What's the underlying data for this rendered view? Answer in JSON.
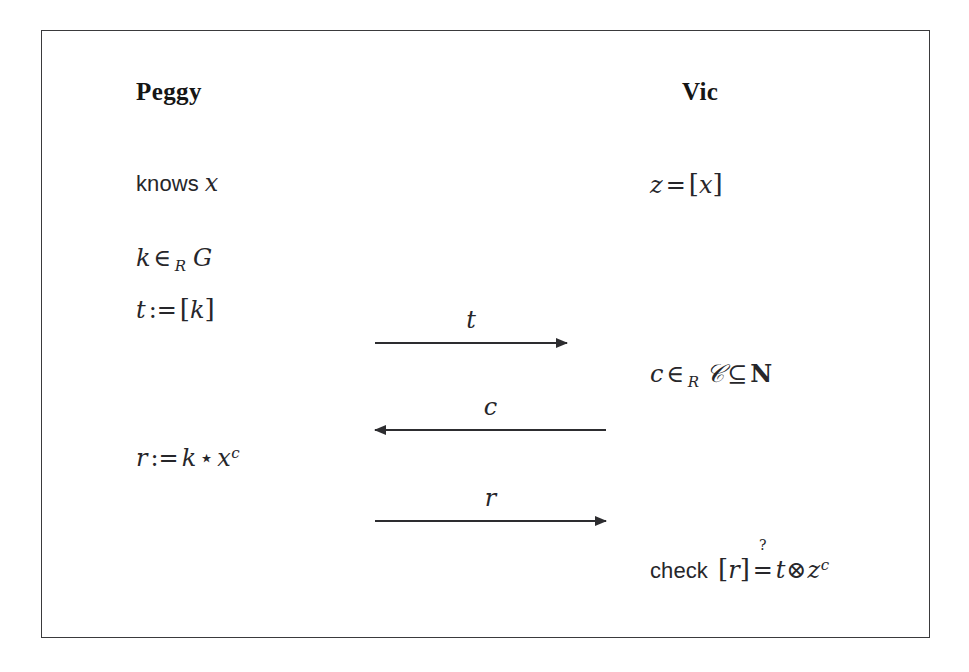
{
  "figure": {
    "title_peggy": "Peggy",
    "title_vic": "Vic",
    "frame_color": "#3a3a3c",
    "background_color": "#ffffff",
    "text_color": "#26262a"
  },
  "prover": {
    "label": "Peggy",
    "lines": [
      {
        "id": "knows-x",
        "plain": "knows x"
      },
      {
        "id": "k-in-g",
        "plain": "k ∈_R G"
      },
      {
        "id": "t-assign",
        "plain": "t := [k]"
      },
      {
        "id": "r-assign",
        "plain": "r := k ⋆ x^c"
      }
    ],
    "knows_word": "knows",
    "knows_var": "x",
    "k_var": "k",
    "in_op": "∈",
    "in_sub": "R",
    "group": "G",
    "t_var": "t",
    "assign_op": ":=",
    "bracket_open": "[",
    "bracket_close": "]",
    "t_inner": "k",
    "r_var": "r",
    "r_k": "k",
    "star_op": "⋆",
    "r_x": "x",
    "r_exp": "c"
  },
  "verifier": {
    "label": "Vic",
    "lines": [
      {
        "id": "z-eq",
        "plain": "z = [x]"
      },
      {
        "id": "c-in-C",
        "plain": "c ∈_R 𝒞 ⊆ N"
      },
      {
        "id": "check",
        "plain": "check [r] ≟ t⊗z^c"
      }
    ],
    "z_var": "z",
    "eq_op": "=",
    "bracket_open": "[",
    "bracket_close": "]",
    "z_inner": "x",
    "c_var": "c",
    "in_op": "∈",
    "in_sub": "R",
    "challenge_set": "𝒞",
    "subset_op": "⊆",
    "naturals": "N",
    "check_word": "check",
    "check_r": "r",
    "question_mark": "?",
    "check_eq": "=",
    "check_t": "t",
    "tensor_op": "⊗",
    "check_z": "z",
    "check_exp": "c"
  },
  "messages": [
    {
      "id": "commitment",
      "label": "t",
      "direction": "right"
    },
    {
      "id": "challenge",
      "label": "c",
      "direction": "left"
    },
    {
      "id": "response",
      "label": "r",
      "direction": "right"
    }
  ]
}
